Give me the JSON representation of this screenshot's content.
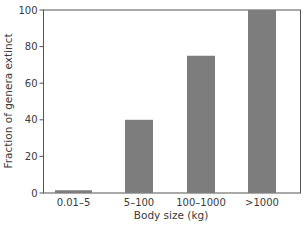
{
  "chart_data": {
    "type": "bar",
    "title": "",
    "xlabel": "Body size (kg)",
    "ylabel": "Fraction of genera extinct",
    "categories": [
      "0.01–5",
      "5–100",
      "100–1000",
      ">1000"
    ],
    "values": [
      1.5,
      40,
      75,
      100
    ],
    "ylim": [
      0,
      100
    ],
    "yticks": [
      0,
      20,
      40,
      60,
      80,
      100
    ],
    "grid": false,
    "legend": null,
    "bar_color": "#7d7d7d",
    "axis_color": "#555555"
  }
}
